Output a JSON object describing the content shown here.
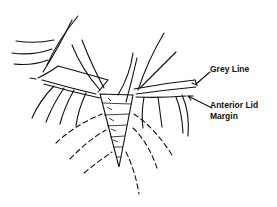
{
  "diagram": {
    "labels": {
      "grey_line": "Grey Line",
      "anterior_lid_margin_line1": "Anterior Lid",
      "anterior_lid_margin_line2": "Margin"
    },
    "colors": {
      "stroke": "#111111",
      "background": "#ffffff"
    }
  }
}
